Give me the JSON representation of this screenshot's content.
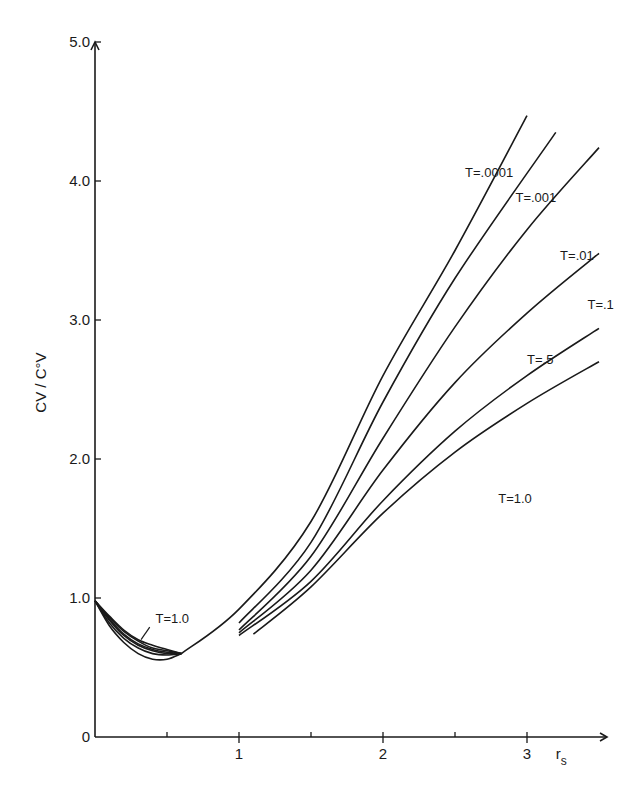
{
  "chart_data": {
    "type": "line",
    "title": "",
    "xlabel": "r_s",
    "ylabel": "C_V / C°_V",
    "xlim": [
      0,
      3.5
    ],
    "ylim": [
      0,
      5.0
    ],
    "grid": false,
    "legend": "inline curve labels",
    "x_ticks": [
      {
        "value": 0.5,
        "label": ""
      },
      {
        "value": 1,
        "label": "1"
      },
      {
        "value": 1.5,
        "label": ""
      },
      {
        "value": 2,
        "label": "2"
      },
      {
        "value": 2.5,
        "label": ""
      },
      {
        "value": 3,
        "label": "3"
      }
    ],
    "y_ticks": [
      {
        "value": 0,
        "label": "0"
      },
      {
        "value": 1.0,
        "label": "1.0"
      },
      {
        "value": 2.0,
        "label": "2.0"
      },
      {
        "value": 3.0,
        "label": "3.0"
      },
      {
        "value": 4.0,
        "label": "4.0"
      },
      {
        "value": 5.0,
        "label": "5.0"
      }
    ],
    "series": [
      {
        "name": "T=.0001",
        "label": "T=.0001",
        "low_branch": [
          [
            0,
            0.98
          ],
          [
            0.1,
            0.8
          ],
          [
            0.2,
            0.68
          ],
          [
            0.3,
            0.6
          ],
          [
            0.4,
            0.56
          ],
          [
            0.5,
            0.56
          ],
          [
            0.6,
            0.6
          ]
        ],
        "high_branch": [
          [
            0.6,
            0.6
          ],
          [
            1.0,
            0.92
          ],
          [
            1.5,
            1.55
          ],
          [
            2.0,
            2.6
          ],
          [
            2.5,
            3.5
          ],
          [
            3.0,
            4.47
          ]
        ]
      },
      {
        "name": "T=.001",
        "label": "T=.001",
        "low_branch": [
          [
            0,
            0.98
          ],
          [
            0.1,
            0.82
          ],
          [
            0.2,
            0.71
          ],
          [
            0.3,
            0.64
          ],
          [
            0.4,
            0.6
          ],
          [
            0.5,
            0.59
          ],
          [
            0.6,
            0.6
          ]
        ],
        "high_branch": [
          [
            1.0,
            0.82
          ],
          [
            1.5,
            1.4
          ],
          [
            2.0,
            2.41
          ],
          [
            2.5,
            3.3
          ],
          [
            3.2,
            4.35
          ]
        ]
      },
      {
        "name": "T=.01",
        "label": "T=.01",
        "low_branch": [
          [
            0,
            0.98
          ],
          [
            0.1,
            0.84
          ],
          [
            0.2,
            0.73
          ],
          [
            0.3,
            0.66
          ],
          [
            0.4,
            0.62
          ],
          [
            0.5,
            0.6
          ],
          [
            0.6,
            0.6
          ]
        ],
        "high_branch": [
          [
            1.0,
            0.77
          ],
          [
            1.5,
            1.3
          ],
          [
            2.0,
            2.15
          ],
          [
            2.5,
            2.95
          ],
          [
            3.0,
            3.65
          ],
          [
            3.5,
            4.24
          ]
        ]
      },
      {
        "name": "T=.1",
        "label": "T=.1",
        "low_branch": [
          [
            0,
            0.98
          ],
          [
            0.1,
            0.85
          ],
          [
            0.2,
            0.74
          ],
          [
            0.3,
            0.67
          ],
          [
            0.4,
            0.63
          ],
          [
            0.5,
            0.61
          ],
          [
            0.6,
            0.6
          ]
        ],
        "high_branch": [
          [
            1.0,
            0.75
          ],
          [
            1.5,
            1.2
          ],
          [
            2.0,
            1.92
          ],
          [
            2.5,
            2.55
          ],
          [
            3.0,
            3.05
          ],
          [
            3.5,
            3.48
          ]
        ]
      },
      {
        "name": "T=.5",
        "label": "T=.5",
        "low_branch": [
          [
            0,
            0.98
          ],
          [
            0.1,
            0.86
          ],
          [
            0.2,
            0.76
          ],
          [
            0.3,
            0.69
          ],
          [
            0.4,
            0.64
          ],
          [
            0.5,
            0.62
          ],
          [
            0.6,
            0.6
          ]
        ],
        "high_branch": [
          [
            1.0,
            0.73
          ],
          [
            1.5,
            1.12
          ],
          [
            2.0,
            1.7
          ],
          [
            2.5,
            2.2
          ],
          [
            3.0,
            2.6
          ],
          [
            3.5,
            2.94
          ]
        ]
      },
      {
        "name": "T=1.0",
        "label": "T=1.0",
        "low_branch": [
          [
            0,
            0.98
          ],
          [
            0.1,
            0.87
          ],
          [
            0.2,
            0.77
          ],
          [
            0.3,
            0.7
          ],
          [
            0.4,
            0.66
          ],
          [
            0.5,
            0.63
          ],
          [
            0.6,
            0.6
          ]
        ],
        "high_branch": [
          [
            1.1,
            0.74
          ],
          [
            1.5,
            1.08
          ],
          [
            2.0,
            1.61
          ],
          [
            2.5,
            2.05
          ],
          [
            3.0,
            2.4
          ],
          [
            3.5,
            2.7
          ]
        ]
      }
    ],
    "annotations": [
      {
        "text": "T=.0001",
        "x": 2.57,
        "y": 4.03
      },
      {
        "text": "T=.001",
        "x": 2.92,
        "y": 3.85
      },
      {
        "text": "T=.01",
        "x": 3.23,
        "y": 3.43
      },
      {
        "text": "T=.1",
        "x": 3.42,
        "y": 3.08
      },
      {
        "text": "T=.5",
        "x": 3.0,
        "y": 2.68
      },
      {
        "text": "T=1.0",
        "x": 2.8,
        "y": 1.68
      },
      {
        "text": "T=1.0",
        "x": 0.42,
        "y": 0.82
      }
    ]
  }
}
